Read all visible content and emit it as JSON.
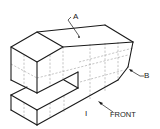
{
  "figure": {
    "type": "isometric technical drawing",
    "labels": {
      "a": "A",
      "b": "B",
      "front": "FRONT",
      "view_mark": "I"
    },
    "colors": {
      "line": "#1a1a1a",
      "grid": "#8a8a8a",
      "background": "#ffffff"
    }
  }
}
